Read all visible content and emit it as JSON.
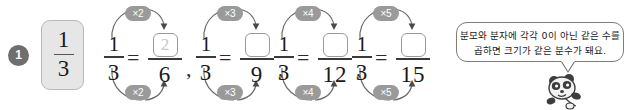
{
  "problem": {
    "number": "1",
    "sample_fraction": {
      "numerator": "1",
      "denominator": "3"
    }
  },
  "equations": [
    {
      "left": {
        "numerator": "1",
        "denominator": "3"
      },
      "right": {
        "numerator": "2",
        "denominator": "6"
      },
      "numerator_filled": true,
      "multiplier_top": "×2",
      "multiplier_bottom": "×2",
      "separator": ","
    },
    {
      "left": {
        "numerator": "1",
        "denominator": "3"
      },
      "right": {
        "numerator": "",
        "denominator": "9"
      },
      "numerator_filled": false,
      "multiplier_top": "×3",
      "multiplier_bottom": "×3",
      "separator": ","
    },
    {
      "left": {
        "numerator": "1",
        "denominator": "3"
      },
      "right": {
        "numerator": "",
        "denominator": "12"
      },
      "numerator_filled": false,
      "multiplier_top": "×4",
      "multiplier_bottom": "×4",
      "separator": ","
    },
    {
      "left": {
        "numerator": "1",
        "denominator": "3"
      },
      "right": {
        "numerator": "",
        "denominator": "15"
      },
      "numerator_filled": false,
      "multiplier_top": "×5",
      "multiplier_bottom": "×5",
      "separator": ""
    }
  ],
  "equals_sign": "=",
  "hint_bubble": {
    "line1": "분모와 분자에 각각 0이 아닌 같은 수를",
    "line2": "곱하면 크기가 같은 분수가 돼요."
  },
  "colors": {
    "pill_background": "#9a9a9a",
    "badge_background": "#6e6e6e",
    "card_background": "#e6e6e6",
    "card_border": "#b9b9b9",
    "answer_box_border": "#9a9a9a",
    "sample_answer_text": "#c9c9c9",
    "bubble_border": "#7d7d7d",
    "arrow_stroke": "#6b6b6b"
  }
}
